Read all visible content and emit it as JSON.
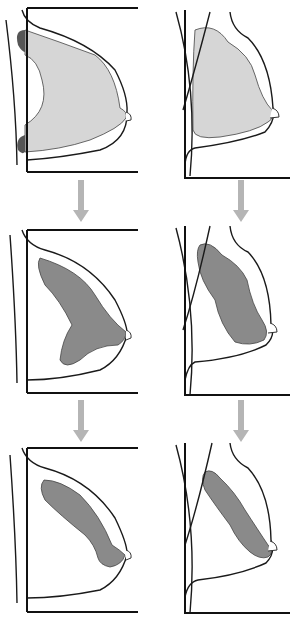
{
  "diagram": {
    "colors": {
      "light_tissue": "#d6d6d6",
      "dark_tissue": "#8a8a8a",
      "pectoral_dark": "#555555",
      "arrow": "#b5b5b5",
      "line": "#1a1a1a",
      "background": "#ffffff"
    },
    "columns": [
      {
        "view": "cc",
        "label": ""
      },
      {
        "view": "mlo",
        "label": ""
      }
    ],
    "panels": [
      {
        "id": "cc-stage-1",
        "frame": "M27,8 L138,8 M27,8 L27,172 M27,172 L138,172",
        "skin": "M6,20 Q16,100 17,165",
        "outline": "M22,10 Q25,22 40,28 Q90,42 115,70 Q128,95 127,112 Q128,140 100,150 Q60,158 27,160",
        "tissue": "M25,30 Q60,42 95,55 Q115,70 120,108 Q128,112 126,118 Q120,128 90,140 Q60,150 25,152 L25,125 Q50,110 42,80 Q38,60 25,55 Z",
        "tissue_fill": "light_tissue",
        "accents": [
          "M25,30 Q14,30 18,45 Q22,52 25,52 Z",
          "M25,135 Q15,138 18,150 Q22,155 25,152 Z"
        ]
      },
      {
        "id": "mlo-stage-1",
        "frame": "M185,10 L185,178 L290,178",
        "skin": "M176,12 Q198,90 190,176",
        "pectoral": "M210,12 Q195,70 183,110",
        "outline": "M230,12 Q232,30 248,38 Q270,60 273,108 Q276,120 265,132 Q240,142 195,148 Q186,150 185,165",
        "tissue": "M195,30 Q215,22 228,42 Q250,55 255,75 Q262,100 272,110 Q275,118 268,122 Q255,132 220,137 Q195,140 193,130 Q192,70 195,30 Z",
        "tissue_fill": "light_tissue"
      },
      {
        "id": "cc-stage-2",
        "frame": "M27,230 L138,230 M27,230 L27,393 M27,393 L138,393",
        "skin": "M10,235 Q16,320 17,383",
        "outline": "M22,230 Q27,245 45,250 Q90,262 115,300 Q128,325 127,335 Q120,360 100,370 Q60,380 27,380",
        "tissue": "M40,258 Q80,270 95,295 Q110,320 126,332 Q126,340 118,345 Q95,345 80,360 Q65,370 60,360 Q62,340 72,325 Q60,300 45,285 Q35,265 40,258 Z",
        "tissue_fill": "dark_tissue"
      },
      {
        "id": "mlo-stage-2",
        "frame": "M185,226 L185,395 L290,395",
        "skin": "M176,228 Q198,310 190,395",
        "pectoral": "M210,226 Q196,290 183,330",
        "outline": "M230,226 Q232,245 248,252 Q270,275 271,325 Q276,335 266,345 Q240,358 195,362 Q188,365 185,380",
        "tissue": "M200,245 Q210,240 222,255 Q240,265 247,280 Q252,305 262,320 Q270,332 264,340 Q250,347 235,342 Q220,325 215,300 Q200,280 198,262 Q196,250 200,245 Z",
        "tissue_fill": "dark_tissue"
      },
      {
        "id": "cc-stage-3",
        "frame": "M27,448 L138,448 M27,448 L27,612 M27,612 L138,612",
        "skin": "M10,455 Q16,540 17,603",
        "outline": "M22,448 Q27,463 45,468 Q90,480 115,518 Q128,545 127,555 Q120,580 100,590 Q60,598 27,598",
        "tissue": "M44,480 Q60,480 80,495 Q100,515 112,545 Q120,550 125,555 Q122,565 110,567 Q100,565 98,558 Q95,545 85,535 Q60,515 45,500 Q38,487 44,480 Z",
        "tissue_fill": "dark_tissue"
      },
      {
        "id": "mlo-stage-3",
        "frame": "M185,443 L185,613 L290,613",
        "skin": "M176,445 Q198,525 190,613",
        "pectoral": "M212,443 Q198,505 185,545",
        "outline": "M230,443 Q232,460 248,468 Q270,492 271,540 Q276,553 266,563 Q240,575 198,580 Q188,582 185,597",
        "tissue": "M205,472 Q212,468 220,478 Q235,492 245,510 Q258,530 268,545 Q275,552 268,557 Q260,560 250,552 Q238,542 230,525 Q215,505 205,490 Q200,478 205,472 Z",
        "tissue_fill": "dark_tissue"
      }
    ],
    "nipples": [
      "M126,112 Q132,114 131,120 L126,121",
      "M272,108 Q279,110 279,117 L270,118",
      "M126,330 Q132,332 131,338 L126,340",
      "M270,323 Q277,325 277,332 L268,333",
      "M126,550 Q132,552 131,558 L126,560",
      "M270,541 Q277,543 277,550 L268,551"
    ],
    "arrows": [
      {
        "id": "cc-arrow-1",
        "x": 81,
        "y1": 180,
        "y2": 222
      },
      {
        "id": "mlo-arrow-1",
        "x": 241,
        "y1": 180,
        "y2": 222
      },
      {
        "id": "cc-arrow-2",
        "x": 81,
        "y1": 400,
        "y2": 442
      },
      {
        "id": "mlo-arrow-2",
        "x": 241,
        "y1": 400,
        "y2": 442
      }
    ]
  }
}
